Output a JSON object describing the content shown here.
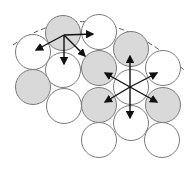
{
  "diagram": {
    "colors": {
      "filled": "#d9d9d9",
      "empty": "#ffffff",
      "stroke": "#7a7a7a",
      "arrow": "#111111",
      "boundary": "#555555"
    },
    "boundary": {
      "style": "dashed-arc"
    },
    "particles": [
      {
        "id": "p1",
        "state": "filled"
      },
      {
        "id": "p2",
        "state": "empty"
      },
      {
        "id": "p3",
        "state": "empty"
      },
      {
        "id": "p4",
        "state": "empty"
      },
      {
        "id": "p5",
        "state": "filled"
      },
      {
        "id": "p6",
        "state": "empty"
      },
      {
        "id": "p7",
        "state": "filled"
      },
      {
        "id": "p8",
        "state": "filled"
      },
      {
        "id": "p9",
        "state": "empty"
      },
      {
        "id": "p10",
        "state": "empty"
      },
      {
        "id": "p11",
        "state": "filled"
      },
      {
        "id": "p12",
        "state": "filled"
      },
      {
        "id": "p13",
        "state": "empty"
      },
      {
        "id": "p14",
        "state": "empty"
      },
      {
        "id": "p15",
        "state": "empty"
      }
    ],
    "arrow_groups": [
      {
        "name": "surface-site-arrows",
        "count": 4
      },
      {
        "name": "bulk-site-arrows",
        "count": 6
      }
    ]
  }
}
